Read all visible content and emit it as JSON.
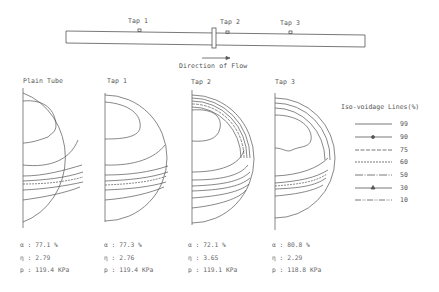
{
  "pipe": {
    "taps": [
      {
        "label": "Tap 1"
      },
      {
        "label": "Tap 2"
      },
      {
        "label": "Tap 3"
      }
    ],
    "flow_label": "Direction of Flow"
  },
  "panels": [
    {
      "title": "Plain Tube",
      "alpha": "α : 77.1  %",
      "eta": "η : 2.79",
      "pressure": "p : 119.4 KPa"
    },
    {
      "title": "Tap 1",
      "alpha": "α : 77.3  %",
      "eta": "η : 2.76",
      "pressure": "p : 119.4 KPa"
    },
    {
      "title": "Tap 2",
      "alpha": "α : 72.1  %",
      "eta": "η : 3.65",
      "pressure": "p : 119.1 KPa"
    },
    {
      "title": "Tap 3",
      "alpha": "α : 80.8  %",
      "eta": "η : 2.29",
      "pressure": "p : 118.8 KPa"
    }
  ],
  "legend": {
    "title": "Iso-voidage Lines(%)",
    "entries": [
      {
        "value": "99",
        "style": "solid"
      },
      {
        "value": "90",
        "style": "solid-dot-marker"
      },
      {
        "value": "75",
        "style": "long-dash"
      },
      {
        "value": "60",
        "style": "short-dash"
      },
      {
        "value": "50",
        "style": "dash-dot"
      },
      {
        "value": "30",
        "style": "solid-triangle-marker"
      },
      {
        "value": "10",
        "style": "dash-dot-dot"
      }
    ]
  }
}
